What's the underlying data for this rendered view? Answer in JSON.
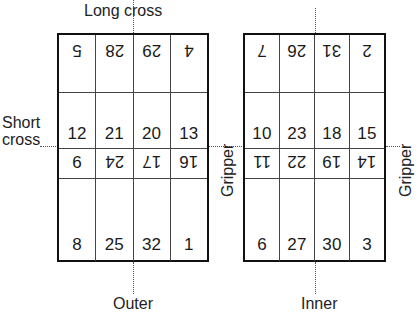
{
  "figure": {
    "labels": {
      "long_cross": "Long cross",
      "short_cross_line1": "Short",
      "short_cross_line2": "cross",
      "gripper_middle": "Gripper",
      "gripper_right": "Gripper",
      "outer": "Outer",
      "inner": "Inner"
    },
    "tables": [
      {
        "name": "outer",
        "caption": "Outer",
        "rows": [
          {
            "orientation": "inverted",
            "values": [
              "5",
              "28",
              "29",
              "4"
            ]
          },
          {
            "orientation": "upright",
            "values": [
              "12",
              "21",
              "20",
              "13"
            ]
          },
          {
            "orientation": "inverted",
            "values": [
              "9",
              "24",
              "17",
              "16"
            ]
          },
          {
            "orientation": "upright",
            "values": [
              "8",
              "25",
              "32",
              "1"
            ]
          }
        ]
      },
      {
        "name": "inner",
        "caption": "Inner",
        "rows": [
          {
            "orientation": "inverted",
            "values": [
              "7",
              "26",
              "31",
              "2"
            ]
          },
          {
            "orientation": "upright",
            "values": [
              "10",
              "23",
              "18",
              "15"
            ]
          },
          {
            "orientation": "inverted",
            "values": [
              "11",
              "22",
              "19",
              "14"
            ]
          },
          {
            "orientation": "upright",
            "values": [
              "6",
              "27",
              "30",
              "3"
            ]
          }
        ]
      }
    ]
  },
  "colors": {
    "border": "#111111",
    "gridline": "#444444",
    "guide": "#555555",
    "text": "#1a1a1a",
    "background": "#ffffff"
  }
}
